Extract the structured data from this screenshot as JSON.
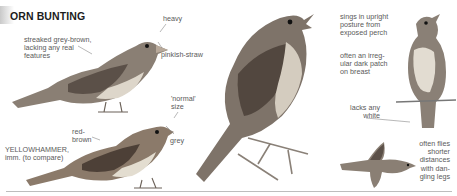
{
  "header": {
    "title": "ORN BUNTING"
  },
  "annotations": {
    "streaked": "streaked grey-brown,\nlacking any real\nfeatures",
    "heavy": "heavy",
    "pinkish_straw": "pinkish-straw",
    "normal_size": "'normal'\nsize",
    "red_brown": "red-\nbrown",
    "grey": "grey",
    "yellowhammer": "YELLOWHAMMER,\nimm. (to compare)",
    "sings": "sings in upright\nposture from\nexposed perch",
    "dark_patch": "often an irreg-\nular dark patch\non breast",
    "lacks_white": "lacks any\nwhite",
    "flies": "often flies\nshorter\ndistances\nwith dan-\ngling legs"
  },
  "illustrations": [
    {
      "id": "corn-bunting-side",
      "label": "Corn Bunting, side view"
    },
    {
      "id": "yellowhammer-imm",
      "label": "Yellowhammer immature"
    },
    {
      "id": "corn-bunting-singing",
      "label": "Corn Bunting singing on twig"
    },
    {
      "id": "corn-bunting-perched-front",
      "label": "Corn Bunting upright on perch"
    },
    {
      "id": "corn-bunting-flight",
      "label": "Corn Bunting in flight"
    }
  ],
  "colors": {
    "ink": "#1c1c1c",
    "text": "#5a5a5a",
    "bird_dark": "#5b5048",
    "bird_mid": "#8e8378",
    "bird_light": "#d9d2c6"
  }
}
